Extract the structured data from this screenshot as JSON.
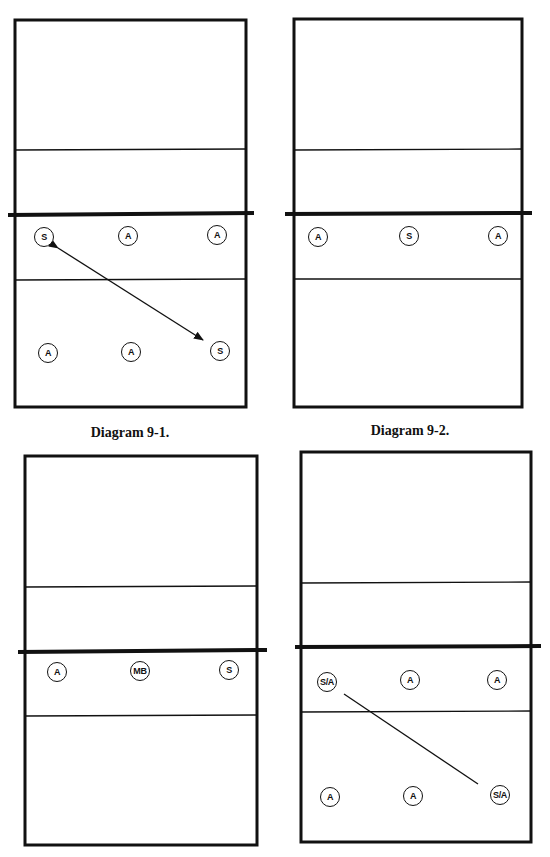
{
  "captions": {
    "diagram_1": "Diagram 9-1.",
    "diagram_2": "Diagram 9-2."
  },
  "colors": {
    "line": "#111111",
    "background": "#ffffff"
  },
  "diagrams": [
    {
      "id": "9-1",
      "caption": "Diagram 9-1.",
      "players": [
        {
          "label": "S",
          "x": 44,
          "y": 237
        },
        {
          "label": "A",
          "x": 128,
          "y": 236
        },
        {
          "label": "A",
          "x": 217,
          "y": 235
        },
        {
          "label": "A",
          "x": 48,
          "y": 353
        },
        {
          "label": "A",
          "x": 131,
          "y": 352
        },
        {
          "label": "S",
          "x": 220,
          "y": 351
        }
      ],
      "connector": {
        "type": "double-arrow",
        "from": "S (front-left)",
        "to": "S (back-right)"
      }
    },
    {
      "id": "9-2",
      "caption": "Diagram 9-2.",
      "players": [
        {
          "label": "A",
          "x": 318,
          "y": 237
        },
        {
          "label": "S",
          "x": 409,
          "y": 236
        },
        {
          "label": "A",
          "x": 498,
          "y": 236
        }
      ]
    },
    {
      "id": "9-3",
      "caption": "",
      "players": [
        {
          "label": "A",
          "x": 57,
          "y": 672
        },
        {
          "label": "MB",
          "x": 140,
          "y": 671
        },
        {
          "label": "S",
          "x": 229,
          "y": 670
        }
      ]
    },
    {
      "id": "9-4",
      "caption": "",
      "players": [
        {
          "label": "S/A",
          "x": 327,
          "y": 682
        },
        {
          "label": "A",
          "x": 410,
          "y": 680
        },
        {
          "label": "A",
          "x": 497,
          "y": 680
        },
        {
          "label": "A",
          "x": 330,
          "y": 797
        },
        {
          "label": "A",
          "x": 413,
          "y": 796
        },
        {
          "label": "S/A",
          "x": 500,
          "y": 795
        }
      ],
      "connector": {
        "type": "line",
        "from": "S/A (front-left)",
        "to": "S/A (back-right)"
      }
    }
  ]
}
